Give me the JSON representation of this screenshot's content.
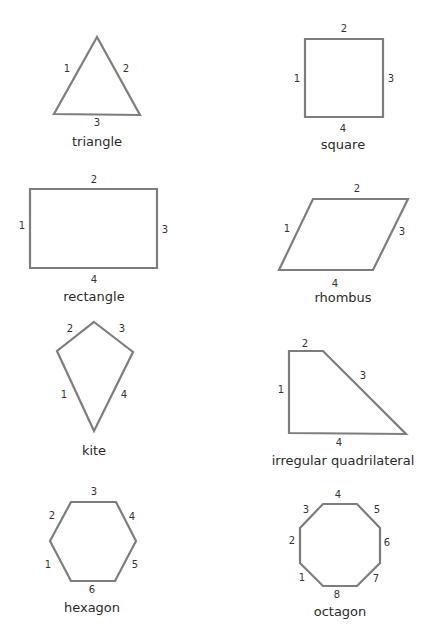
{
  "diagram": {
    "colors": {
      "stroke": "#7d7d7d",
      "text": "#2a2a2a",
      "background": "#ffffff"
    },
    "shapes": [
      {
        "name": "triangle",
        "points": "97,37 140,115 54,114",
        "label": {
          "text": "triangle",
          "x": 97,
          "y": 142
        },
        "sides": [
          {
            "n": "1",
            "x": 67,
            "y": 69
          },
          {
            "n": "2",
            "x": 126,
            "y": 69
          },
          {
            "n": "3",
            "x": 97,
            "y": 123
          }
        ]
      },
      {
        "name": "square",
        "points": "305,39 383,39 383,117 305,117",
        "label": {
          "text": "square",
          "x": 343,
          "y": 145
        },
        "sides": [
          {
            "n": "1",
            "x": 297,
            "y": 79
          },
          {
            "n": "2",
            "x": 344,
            "y": 29
          },
          {
            "n": "3",
            "x": 391,
            "y": 79
          },
          {
            "n": "4",
            "x": 343,
            "y": 129
          }
        ]
      },
      {
        "name": "rectangle",
        "points": "30,189 157,189 157,268 30,268",
        "label": {
          "text": "rectangle",
          "x": 94,
          "y": 297
        },
        "sides": [
          {
            "n": "1",
            "x": 22,
            "y": 226
          },
          {
            "n": "2",
            "x": 94,
            "y": 180
          },
          {
            "n": "3",
            "x": 165,
            "y": 230
          },
          {
            "n": "4",
            "x": 94,
            "y": 280
          }
        ]
      },
      {
        "name": "rhombus",
        "points": "313,199 408,199 373,270 279,270",
        "label": {
          "text": "rhombus",
          "x": 343,
          "y": 298
        },
        "sides": [
          {
            "n": "1",
            "x": 287,
            "y": 229
          },
          {
            "n": "2",
            "x": 357,
            "y": 189
          },
          {
            "n": "3",
            "x": 402,
            "y": 232
          },
          {
            "n": "4",
            "x": 335,
            "y": 284
          }
        ]
      },
      {
        "name": "kite",
        "points": "94,322 133,352 94,431 57,351",
        "label": {
          "text": "kite",
          "x": 94,
          "y": 451
        },
        "sides": [
          {
            "n": "1",
            "x": 64,
            "y": 395
          },
          {
            "n": "2",
            "x": 70,
            "y": 329
          },
          {
            "n": "3",
            "x": 122,
            "y": 329
          },
          {
            "n": "4",
            "x": 124,
            "y": 395
          }
        ]
      },
      {
        "name": "irregular-quadrilateral",
        "points": "289,351 323,351 406,434 289,433",
        "label": {
          "text": "irregular quadrilateral",
          "x": 343,
          "y": 461
        },
        "sides": [
          {
            "n": "1",
            "x": 281,
            "y": 390
          },
          {
            "n": "2",
            "x": 305,
            "y": 344
          },
          {
            "n": "3",
            "x": 363,
            "y": 376
          },
          {
            "n": "4",
            "x": 339,
            "y": 443
          }
        ]
      },
      {
        "name": "hexagon",
        "points": "71,502 116,502 136,541 115,581 71,581 50,541",
        "label": {
          "text": "hexagon",
          "x": 92,
          "y": 608
        },
        "sides": [
          {
            "n": "1",
            "x": 48,
            "y": 565
          },
          {
            "n": "2",
            "x": 52,
            "y": 516
          },
          {
            "n": "3",
            "x": 94,
            "y": 492
          },
          {
            "n": "4",
            "x": 132,
            "y": 517
          },
          {
            "n": "5",
            "x": 135,
            "y": 565
          },
          {
            "n": "6",
            "x": 92,
            "y": 590
          }
        ]
      },
      {
        "name": "octagon",
        "points": "323,504 357,504 380,528 380,563 357,586 323,586 300,563 300,528",
        "label": {
          "text": "octagon",
          "x": 340,
          "y": 612
        },
        "sides": [
          {
            "n": "1",
            "x": 302,
            "y": 578
          },
          {
            "n": "2",
            "x": 292,
            "y": 541
          },
          {
            "n": "3",
            "x": 306,
            "y": 510
          },
          {
            "n": "4",
            "x": 338,
            "y": 495
          },
          {
            "n": "5",
            "x": 377,
            "y": 510
          },
          {
            "n": "6",
            "x": 387,
            "y": 543
          },
          {
            "n": "7",
            "x": 376,
            "y": 579
          },
          {
            "n": "8",
            "x": 337,
            "y": 595
          }
        ]
      }
    ]
  }
}
